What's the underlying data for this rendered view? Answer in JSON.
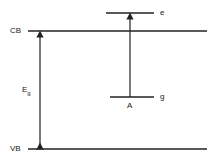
{
  "diagram": {
    "labels": {
      "cb": "CB",
      "vb": "VB",
      "eg": "E",
      "eg_sub": "g",
      "excited": "e",
      "ground": "g",
      "transition": "A"
    },
    "line_color": "#222222"
  }
}
